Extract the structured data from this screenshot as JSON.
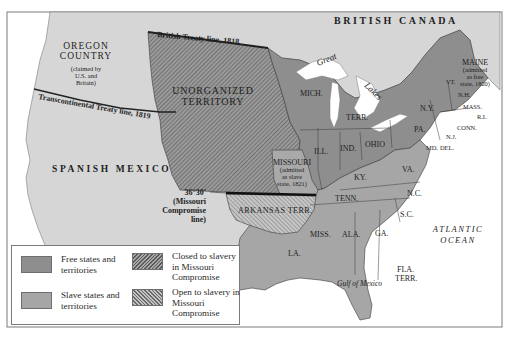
{
  "map": {
    "regions": {
      "british_canada": "BRITISH CANADA",
      "oregon_country": {
        "name_line1": "OREGON",
        "name_line2": "COUNTRY",
        "note_line1": "(claimed by",
        "note_line2": "U.S. and",
        "note_line3": "Britain)"
      },
      "unorganized_territory": {
        "line1": "UNORGANIZED",
        "line2": "TERRITORY"
      },
      "spanish_mexico": "SPANISH MEXICO",
      "missouri": {
        "name": "MISSOURI",
        "note_line1": "(admitted",
        "note_line2": "as slave",
        "note_line3": "state, 1821)"
      },
      "maine": {
        "name": "MAINE",
        "note_line1": "(admitted",
        "note_line2": "as free",
        "note_line3": "state, 1820)"
      },
      "arkansas_terr": "ARKANSAS TERR.",
      "fla_terr": {
        "line1": "FLA.",
        "line2": "TERR."
      }
    },
    "states": {
      "mich": "MICH.",
      "terr": "TERR.",
      "ill": "ILL.",
      "ind": "IND.",
      "ohio": "OHIO",
      "ky": "KY.",
      "tenn": "TENN.",
      "va": "VA.",
      "nc": "N.C.",
      "sc": "S.C.",
      "ga": "GA.",
      "ala": "ALA.",
      "miss": "MISS.",
      "la": "LA.",
      "pa": "PA.",
      "ny": "N.Y.",
      "vt": "VT.",
      "nh": "N.H.",
      "mass": "MASS.",
      "ri": "R.I.",
      "conn": "CONN.",
      "nj": "N.J.",
      "md": "MD.",
      "del": "DEL."
    },
    "lines": {
      "british_treaty": "British Treaty line, 1818",
      "transcontinental_treaty": "Transcontinental Treaty line, 1819",
      "missouri_compromise": {
        "line1": "36°30'",
        "line2": "(Missouri",
        "line3": "Compromise",
        "line4": "line)"
      }
    },
    "water": {
      "great_lakes_1": "Great",
      "great_lakes_2": "Lakes",
      "atlantic_1": "ATLANTIC",
      "atlantic_2": "OCEAN",
      "gulf": "Gulf of Mexico"
    },
    "colors": {
      "free": "#8e8e8e",
      "slave": "#a6a6a6",
      "foreign": "#d6d6d6",
      "water": "#ffffff",
      "border": "#3a3a3a"
    }
  },
  "legend": {
    "items": [
      {
        "label": "Free states and territories",
        "pattern": "solid-dark"
      },
      {
        "label": "Closed to slavery in Missouri Compromise",
        "pattern": "hatch-dark"
      },
      {
        "label": "Slave states and territories",
        "pattern": "solid-light"
      },
      {
        "label": "Open to slavery in Missouri Compromise",
        "pattern": "hatch-light"
      }
    ]
  }
}
